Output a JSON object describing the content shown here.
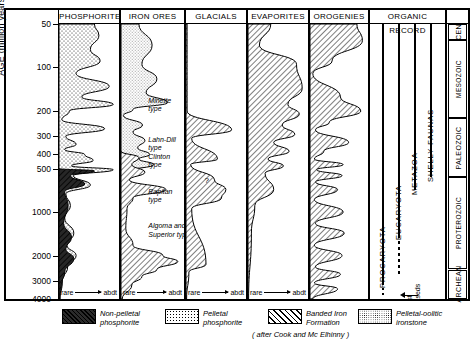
{
  "figure": {
    "axis_label": "AGE (million years)",
    "credit": "( after  Cook and  Mc Elhinny )",
    "scale_low": "rare",
    "scale_high": "abdt"
  },
  "chart_data": {
    "type": "area",
    "title": "AGE (million years)",
    "ylabel": "AGE (million years)",
    "xlabel": "",
    "yscale": "log",
    "ylim": [
      50,
      4000
    ],
    "yticks": [
      50,
      100,
      200,
      300,
      400,
      500,
      1000,
      2000,
      3000,
      4000
    ],
    "ytick_labels": [
      "50",
      "100",
      "200",
      "300",
      "400",
      "500",
      "1000",
      "2000",
      "3000",
      "4000"
    ],
    "grid": false,
    "legend_position": "below",
    "columns": [
      {
        "name": "PHOSPHORITES",
        "axis_low": "rare",
        "axis_high": "abdt",
        "series": [
          {
            "name": "Pelletal phosphorite",
            "fill": "pelletal",
            "points": [
              {
                "age": 50,
                "abundance": 0.62
              },
              {
                "age": 60,
                "abundance": 0.7
              },
              {
                "age": 75,
                "abundance": 0.55
              },
              {
                "age": 90,
                "abundance": 0.72
              },
              {
                "age": 110,
                "abundance": 0.3
              },
              {
                "age": 135,
                "abundance": 0.88
              },
              {
                "age": 160,
                "abundance": 0.4
              },
              {
                "age": 180,
                "abundance": 0.95
              },
              {
                "age": 200,
                "abundance": 0.18
              },
              {
                "age": 230,
                "abundance": 0.05
              },
              {
                "age": 265,
                "abundance": 0.8
              },
              {
                "age": 300,
                "abundance": 0.12
              },
              {
                "age": 340,
                "abundance": 0.3
              },
              {
                "age": 370,
                "abundance": 0.1
              },
              {
                "age": 400,
                "abundance": 0.45
              },
              {
                "age": 440,
                "abundance": 0.6
              },
              {
                "age": 480,
                "abundance": 0.22
              },
              {
                "age": 510,
                "abundance": 0.95
              },
              {
                "age": 560,
                "abundance": 0.25
              },
              {
                "age": 650,
                "abundance": 0.55
              },
              {
                "age": 750,
                "abundance": 0.12
              },
              {
                "age": 900,
                "abundance": 0.2
              },
              {
                "age": 1100,
                "abundance": 0.1
              },
              {
                "age": 1400,
                "abundance": 0.26
              },
              {
                "age": 1700,
                "abundance": 0.14
              },
              {
                "age": 2000,
                "abundance": 0.3
              },
              {
                "age": 2400,
                "abundance": 0.15
              },
              {
                "age": 3000,
                "abundance": 0.06
              },
              {
                "age": 4000,
                "abundance": 0.02
              }
            ]
          },
          {
            "name": "Non-pelletal phosphorite",
            "fill": "non_pelletal",
            "points": [
              {
                "age": 500,
                "abundance": 0.0
              },
              {
                "age": 520,
                "abundance": 0.62
              },
              {
                "age": 560,
                "abundance": 0.2
              },
              {
                "age": 640,
                "abundance": 0.45
              },
              {
                "age": 720,
                "abundance": 0.1
              },
              {
                "age": 900,
                "abundance": 0.16
              },
              {
                "age": 1200,
                "abundance": 0.08
              },
              {
                "age": 1500,
                "abundance": 0.22
              },
              {
                "age": 1800,
                "abundance": 0.12
              },
              {
                "age": 2100,
                "abundance": 0.26
              },
              {
                "age": 2600,
                "abundance": 0.1
              },
              {
                "age": 3200,
                "abundance": 0.04
              },
              {
                "age": 4000,
                "abundance": 0.01
              }
            ]
          }
        ],
        "annotations": []
      },
      {
        "name": "IRON ORES",
        "axis_low": "rare",
        "axis_high": "abdt",
        "series": [
          {
            "name": "Pelletal-oolitic ironstone",
            "fill": "ironstone",
            "points": [
              {
                "age": 50,
                "abundance": 0.3
              },
              {
                "age": 70,
                "abundance": 0.52
              },
              {
                "age": 95,
                "abundance": 0.35
              },
              {
                "age": 120,
                "abundance": 0.6
              },
              {
                "age": 150,
                "abundance": 0.42
              },
              {
                "age": 175,
                "abundance": 0.78
              },
              {
                "age": 195,
                "abundance": 0.2
              },
              {
                "age": 215,
                "abundance": 0.04
              },
              {
                "age": 250,
                "abundance": 0.36
              },
              {
                "age": 280,
                "abundance": 0.2
              },
              {
                "age": 320,
                "abundance": 0.4
              },
              {
                "age": 360,
                "abundance": 0.28
              },
              {
                "age": 400,
                "abundance": 0.48
              },
              {
                "age": 430,
                "abundance": 0.3
              },
              {
                "age": 470,
                "abundance": 0.55
              },
              {
                "age": 520,
                "abundance": 0.15
              }
            ]
          },
          {
            "name": "Banded Iron Formation",
            "fill": "bif",
            "points": [
              {
                "age": 380,
                "abundance": 0.0
              },
              {
                "age": 420,
                "abundance": 0.3
              },
              {
                "age": 470,
                "abundance": 0.18
              },
              {
                "age": 530,
                "abundance": 0.4
              },
              {
                "age": 600,
                "abundance": 0.14
              },
              {
                "age": 700,
                "abundance": 0.75
              },
              {
                "age": 800,
                "abundance": 0.2
              },
              {
                "age": 950,
                "abundance": 0.1
              },
              {
                "age": 1300,
                "abundance": 0.08
              },
              {
                "age": 1700,
                "abundance": 0.2
              },
              {
                "age": 2000,
                "abundance": 0.7
              },
              {
                "age": 2200,
                "abundance": 0.95
              },
              {
                "age": 2500,
                "abundance": 0.6
              },
              {
                "age": 2800,
                "abundance": 0.35
              },
              {
                "age": 3200,
                "abundance": 0.18
              },
              {
                "age": 4000,
                "abundance": 0.02
              }
            ]
          }
        ],
        "annotations": [
          {
            "text": "Minette\ntype",
            "age": 175
          },
          {
            "text": "Lahn-Dill\ntype",
            "age": 330
          },
          {
            "text": "Clinton\ntype",
            "age": 430
          },
          {
            "text": "Rapitan\ntype",
            "age": 750
          },
          {
            "text": "Algoma and\nSuperior types",
            "age": 1300
          }
        ]
      },
      {
        "name": "GLACIALS",
        "axis_low": "rare",
        "axis_high": "abdt",
        "series": [
          {
            "name": "Glacial episodes",
            "fill": "bif",
            "points": [
              {
                "age": 50,
                "abundance": 0.02
              },
              {
                "age": 200,
                "abundance": 0.02
              },
              {
                "age": 270,
                "abundance": 0.8
              },
              {
                "age": 310,
                "abundance": 0.1
              },
              {
                "age": 430,
                "abundance": 0.55
              },
              {
                "age": 470,
                "abundance": 0.08
              },
              {
                "age": 600,
                "abundance": 0.5
              },
              {
                "age": 700,
                "abundance": 0.7
              },
              {
                "age": 800,
                "abundance": 0.62
              },
              {
                "age": 950,
                "abundance": 0.1
              },
              {
                "age": 2300,
                "abundance": 0.35
              },
              {
                "age": 2600,
                "abundance": 0.05
              },
              {
                "age": 4000,
                "abundance": 0.01
              }
            ]
          }
        ],
        "annotations": [
          {
            "text": "?",
            "age": 620
          }
        ]
      },
      {
        "name": "EVAPORITES",
        "axis_low": "rare",
        "axis_high": "abdt",
        "series": [
          {
            "name": "Evaporite abundance",
            "fill": "bif",
            "points": [
              {
                "age": 50,
                "abundance": 0.4
              },
              {
                "age": 70,
                "abundance": 0.2
              },
              {
                "age": 95,
                "abundance": 0.85
              },
              {
                "age": 140,
                "abundance": 0.95
              },
              {
                "age": 180,
                "abundance": 0.7
              },
              {
                "age": 210,
                "abundance": 0.9
              },
              {
                "age": 250,
                "abundance": 0.6
              },
              {
                "age": 290,
                "abundance": 0.82
              },
              {
                "age": 330,
                "abundance": 0.45
              },
              {
                "age": 380,
                "abundance": 0.72
              },
              {
                "age": 430,
                "abundance": 0.35
              },
              {
                "age": 480,
                "abundance": 0.62
              },
              {
                "age": 540,
                "abundance": 0.3
              },
              {
                "age": 700,
                "abundance": 0.45
              },
              {
                "age": 900,
                "abundance": 0.12
              },
              {
                "age": 1400,
                "abundance": 0.06
              },
              {
                "age": 4000,
                "abundance": 0.01
              }
            ]
          }
        ],
        "annotations": []
      },
      {
        "name": "OROGENIES",
        "axis_low": "",
        "axis_high": "",
        "series": [
          {
            "name": "Orogenic events",
            "fill": "bif",
            "points": [
              {
                "age": 50,
                "abundance": 0.85
              },
              {
                "age": 65,
                "abundance": 0.95
              },
              {
                "age": 90,
                "abundance": 0.4
              },
              {
                "age": 110,
                "abundance": 0.05
              },
              {
                "age": 160,
                "abundance": 0.55
              },
              {
                "age": 200,
                "abundance": 0.92
              },
              {
                "age": 240,
                "abundance": 0.35
              },
              {
                "age": 270,
                "abundance": 0.1
              },
              {
                "age": 330,
                "abundance": 0.7
              },
              {
                "age": 380,
                "abundance": 0.25
              },
              {
                "age": 430,
                "abundance": 0.08
              },
              {
                "age": 470,
                "abundance": 0.6
              },
              {
                "age": 510,
                "abundance": 0.12
              },
              {
                "age": 560,
                "abundance": 0.58
              },
              {
                "age": 620,
                "abundance": 0.1
              },
              {
                "age": 700,
                "abundance": 0.5
              },
              {
                "age": 820,
                "abundance": 0.08
              },
              {
                "age": 1000,
                "abundance": 0.6
              },
              {
                "age": 1200,
                "abundance": 0.1
              },
              {
                "age": 1400,
                "abundance": 0.62
              },
              {
                "age": 1700,
                "abundance": 0.08
              },
              {
                "age": 2000,
                "abundance": 0.58
              },
              {
                "age": 2400,
                "abundance": 0.1
              },
              {
                "age": 2700,
                "abundance": 0.55
              },
              {
                "age": 3100,
                "abundance": 0.08
              },
              {
                "age": 3400,
                "abundance": 0.5
              },
              {
                "age": 4000,
                "abundance": 0.05
              }
            ]
          }
        ],
        "annotations": []
      }
    ],
    "organic_record": {
      "name": "ORGANIC RECORD",
      "lines": [
        {
          "label": "PROCARYOTA",
          "solid_from": 50,
          "solid_to": 3100,
          "dotted_to": 3800
        },
        {
          "label": "EUCARYOTA",
          "solid_from": 50,
          "solid_to": 1450,
          "dashed_to": 2700
        },
        {
          "label": "METAZOA",
          "solid_from": 50,
          "solid_to": 700
        },
        {
          "label": "SHELLY FAUNAS",
          "solid_from": 50,
          "solid_to": 570
        }
      ],
      "note": "oldest\nmetaseds",
      "note_age": 3800
    },
    "eras": [
      {
        "label": "CEN",
        "from": 50,
        "to": 65
      },
      {
        "label": "MESOZOIC",
        "from": 65,
        "to": 225
      },
      {
        "label": "PALEOZOIC",
        "from": 225,
        "to": 570
      },
      {
        "label": "PROTEROZOIC",
        "from": 570,
        "to": 2500
      },
      {
        "label": "ARCHEAN",
        "from": 2500,
        "to": 4000
      }
    ]
  },
  "legend": {
    "items": [
      {
        "label": "Non-pelletal\nphosphorite",
        "pattern": "non_pelletal"
      },
      {
        "label": "Pelletal\nphosphorite",
        "pattern": "pelletal"
      },
      {
        "label": "Banded Iron\nFormation",
        "pattern": "bif"
      },
      {
        "label": "Pelletal-oolitic\nironstone",
        "pattern": "ironstone"
      }
    ]
  }
}
